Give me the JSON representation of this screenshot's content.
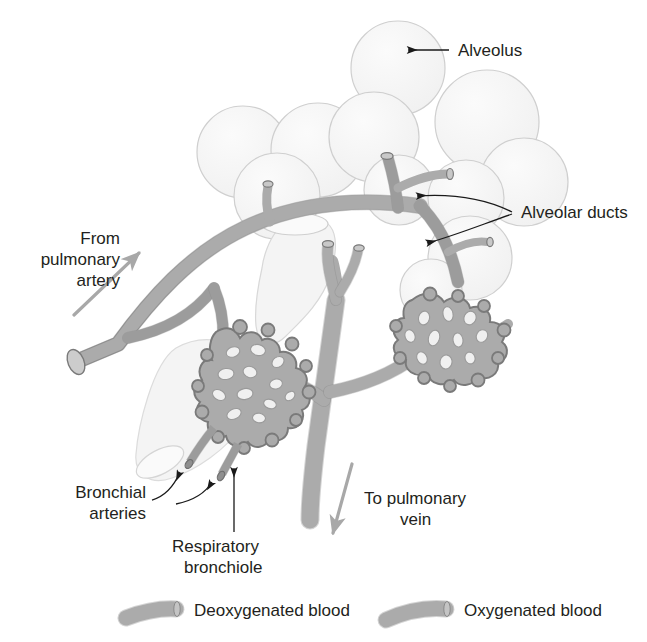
{
  "figure": {
    "background_color": "#ffffff"
  },
  "colors": {
    "vessel_fill": "#a9a9a9",
    "vessel_stroke": "#7a7a7a",
    "alveolus_fill": "#f5f5f5",
    "alveolus_stroke": "#cfcfcf",
    "bronchiole_fill": "#f2f2f2",
    "bronchiole_stroke": "#d2d2d2",
    "text": "#231f20",
    "leader_line": "#1a1a1a",
    "flow_arrow": "#a8a8a8"
  },
  "labels": {
    "alveolus": "Alveolus",
    "alveolar_ducts": "Alveolar ducts",
    "from_pulmonary_artery": [
      "From",
      "pulmonary",
      "artery"
    ],
    "to_pulmonary_vein": [
      "To pulmonary",
      "vein"
    ],
    "bronchial_arteries": [
      "Bronchial",
      "arteries"
    ],
    "respiratory_bronchiole": [
      "Respiratory",
      "bronchiole"
    ]
  },
  "legend": {
    "items": [
      {
        "label": "Deoxygenated blood",
        "swatch": "vessel-segment",
        "color": "#a9a9a9"
      },
      {
        "label": "Oxygenated blood",
        "swatch": "vessel-segment",
        "color": "#a9a9a9"
      }
    ]
  },
  "structures": {
    "alveoli_count": 9,
    "capillary_networks": 2,
    "capillary_network_names": [
      "left-capillary-network",
      "right-capillary-network"
    ]
  }
}
